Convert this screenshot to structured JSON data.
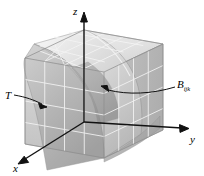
{
  "figure": {
    "name": "triple-integral-box-diagram",
    "background_color": "#ffffff"
  },
  "axes": {
    "z": {
      "label": "z",
      "icon": "axis-arrow-up-icon"
    },
    "y": {
      "label": "y",
      "icon": "axis-arrow-right-icon"
    },
    "x": {
      "label": "x",
      "icon": "axis-arrow-down-left-icon"
    },
    "color": "#000000"
  },
  "callouts": [
    {
      "id": "surface-callout",
      "label_main": "T",
      "label_sub": "",
      "target": "curved surface",
      "arrow": "leader-arrow-icon"
    },
    {
      "id": "subbox-callout",
      "label_main": "B",
      "label_sub": "ijk",
      "target": "interior sub-box",
      "arrow": "leader-arrow-icon"
    }
  ],
  "solid": {
    "name": "rectangular-box",
    "grid_divisions_u": 4,
    "grid_divisions_v": 4,
    "grid_divisions_w": 4,
    "grid_line_color": "#f2f2f2",
    "top_face_color": "#e8e8e8",
    "front_face_color": "#cfcfcf",
    "right_face_color": "#b8b8b8",
    "edge_color": "#9a9a9a"
  },
  "surface": {
    "name": "curved-surface-T",
    "fill_light": "#e4e4e4",
    "fill_mid": "#c6c6c6",
    "fill_dark": "#a8a8a8",
    "edge_color": "#8f8f8f"
  }
}
